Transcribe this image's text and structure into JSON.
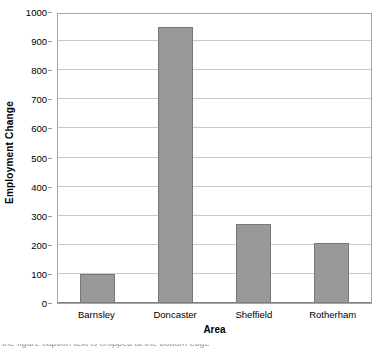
{
  "chart_data": {
    "type": "bar",
    "title": "",
    "categories": [
      "Barnsley",
      "Doncaster",
      "Sheffield",
      "Rotherham"
    ],
    "values": [
      100,
      950,
      270,
      207
    ],
    "xlabel": "Area",
    "ylabel": "Employment Change",
    "ylim": [
      0,
      1000
    ],
    "ytick_step": 100,
    "yticks": [
      0,
      100,
      200,
      300,
      400,
      500,
      600,
      700,
      800,
      900,
      1000
    ],
    "ytick_labels": [
      "0",
      "100",
      "200",
      "300",
      "400",
      "500",
      "600",
      "700",
      "800",
      "900",
      "1000"
    ],
    "grid": "horizontal",
    "legend": "none",
    "bar_color": "#999999",
    "bar_border_color": "#787878",
    "gridline_color": "#c9c9c9",
    "frame_color": "#a6a6a6"
  },
  "caption": {
    "clipped_line": "the figure caption text is cropped at the bottom edge"
  }
}
